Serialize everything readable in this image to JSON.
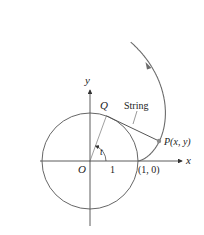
{
  "figure": {
    "type": "involute-of-circle",
    "labels": {
      "x_axis": "x",
      "y_axis": "y",
      "origin": "O",
      "unit_tick": "1",
      "point_on_axis": "(1, 0)",
      "point_q": "Q",
      "point_p": "P(x, y)",
      "string": "String",
      "angle": "t"
    },
    "colors": {
      "curve": "#6b6b6b",
      "axes": "#333333",
      "circle": "#555555",
      "point": "#8a8a8a",
      "text": "#222222"
    }
  }
}
